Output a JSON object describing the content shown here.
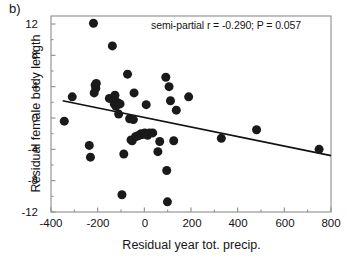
{
  "figure": {
    "panel_letter": "b)",
    "annotation": "semi-partial r = -0.290; P = 0.057",
    "background_color": "#ffffff",
    "frame_color": "#8c8c8c",
    "marker_color": "#1a1a1a",
    "line_color": "#111111"
  },
  "chart_data": {
    "type": "scatter",
    "title": "",
    "subtitle": "",
    "xlabel": "Residual year tot. precip.",
    "ylabel": "Residual female body length",
    "xlim": [
      -400,
      800
    ],
    "ylim": [
      -12,
      12
    ],
    "xticks": [
      -400,
      -200,
      0,
      200,
      400,
      600,
      800
    ],
    "xtick_labels": [
      "-400",
      "-200",
      "0",
      "200",
      "400",
      "600",
      "800"
    ],
    "yticks": [
      12,
      8,
      4,
      0,
      -4,
      -8,
      -12
    ],
    "ytick_labels": [
      "12",
      "8",
      "4",
      "0",
      "-4",
      "-8",
      "-12"
    ],
    "minor_ticks": true,
    "grid": false,
    "legend": null,
    "annotations": [
      {
        "text": "semi-partial r = -0.290; P = 0.057",
        "x": 430,
        "y": 11.2,
        "align": "center"
      }
    ],
    "statistics": {
      "semi_partial_r": -0.29,
      "p_value": 0.057,
      "n_points": 48
    },
    "series": [
      {
        "name": "Residual female body length",
        "marker": "filled-circle",
        "marker_size_px": 9,
        "color": "#1a1a1a",
        "points": [
          [
            -343,
            -0.4
          ],
          [
            -309,
            2.7
          ],
          [
            -236,
            -3.5
          ],
          [
            -231,
            -5.0
          ],
          [
            -218,
            12.1
          ],
          [
            -215,
            3.2
          ],
          [
            -211,
            4.2
          ],
          [
            -208,
            3.8
          ],
          [
            -206,
            4.4
          ],
          [
            -150,
            2.5
          ],
          [
            -137,
            9.2
          ],
          [
            -129,
            1.8
          ],
          [
            -126,
            2.9
          ],
          [
            -122,
            1.5
          ],
          [
            -118,
            2.0
          ],
          [
            -113,
            1.9
          ],
          [
            -110,
            0.5
          ],
          [
            -104,
            1.8
          ],
          [
            -96,
            -9.8
          ],
          [
            -88,
            -4.6
          ],
          [
            -72,
            5.6
          ],
          [
            -63,
            -0.1
          ],
          [
            -57,
            -2.8
          ],
          [
            -52,
            -2.9
          ],
          [
            -47,
            -0.2
          ],
          [
            -44,
            3.2
          ],
          [
            -38,
            -2.4
          ],
          [
            -30,
            -2.3
          ],
          [
            -22,
            -2.2
          ],
          [
            -14,
            -2.0
          ],
          [
            -8,
            -2.1
          ],
          [
            2,
            -1.9
          ],
          [
            8,
            1.7
          ],
          [
            14,
            -2.2
          ],
          [
            22,
            -1.9
          ],
          [
            36,
            -1.9
          ],
          [
            58,
            -4.3
          ],
          [
            66,
            -3.0
          ],
          [
            92,
            5.2
          ],
          [
            96,
            -6.7
          ],
          [
            99,
            -10.7
          ],
          [
            106,
            4.0
          ],
          [
            112,
            2.2
          ],
          [
            126,
            -2.9
          ],
          [
            137,
            1.0
          ],
          [
            190,
            2.7
          ],
          [
            330,
            -2.6
          ],
          [
            481,
            -1.5
          ],
          [
            749,
            -4.0
          ]
        ]
      }
    ],
    "trendline": {
      "type": "linear",
      "x_start": -350,
      "y_start": 2.2,
      "x_end": 800,
      "y_end": -4.8,
      "color": "#111111",
      "width_px": 1.6
    }
  }
}
